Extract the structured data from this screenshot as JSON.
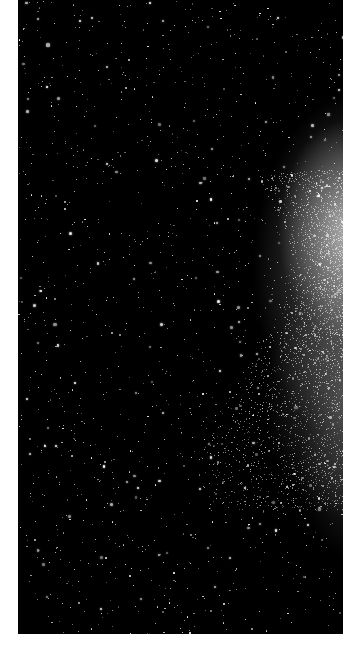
{
  "image": {
    "description": "Black-and-white astronomical photograph of a dense star field with the diffuse, glowing edge of a galaxy / star cloud on the right side",
    "background_color": "#000000",
    "page_color": "#ffffff",
    "star_color": "#ffffff",
    "glow_color": "#d8d8d8"
  }
}
